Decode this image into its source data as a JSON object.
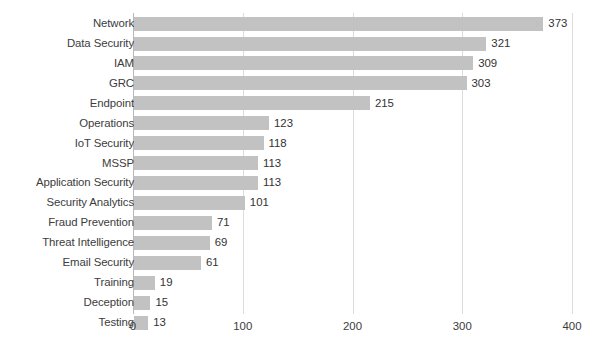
{
  "chart_data": {
    "type": "bar",
    "orientation": "horizontal",
    "title": "",
    "xlabel": "",
    "ylabel": "",
    "xlim": [
      0,
      400
    ],
    "xticks": [
      0,
      100,
      200,
      300,
      400
    ],
    "grid": "vertical-only",
    "legend": "none",
    "bar_color": "#c2c2c2",
    "gridline_color": "#dcdcdc",
    "axis_color": "#b9b9b9",
    "text_color": "#3c3c3c",
    "categories": [
      "Network",
      "Data Security",
      "IAM",
      "GRC",
      "Endpoint",
      "Operations",
      "IoT Security",
      "MSSP",
      "Application Security",
      "Security Analytics",
      "Fraud Prevention",
      "Threat Intelligence",
      "Email Security",
      "Training",
      "Deception",
      "Testing"
    ],
    "values": [
      373,
      321,
      309,
      303,
      215,
      123,
      118,
      113,
      113,
      101,
      71,
      69,
      61,
      19,
      15,
      13
    ],
    "value_labels": [
      "373",
      "321",
      "309",
      "303",
      "215",
      "123",
      "118",
      "113",
      "113",
      "101",
      "71",
      "69",
      "61",
      "19",
      "15",
      "13"
    ],
    "xtick_labels": [
      "0",
      "100",
      "200",
      "300",
      "400"
    ]
  }
}
